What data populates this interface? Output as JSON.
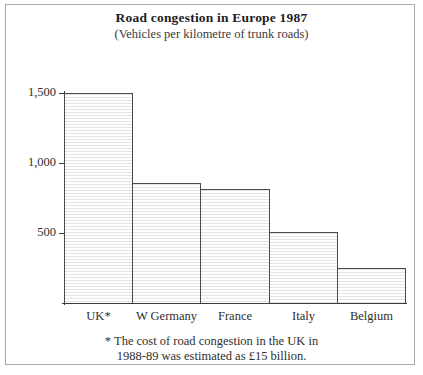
{
  "frame": {
    "border_color": "#a9a9a9",
    "background": "#ffffff"
  },
  "chart_data": {
    "type": "bar",
    "title": "Road congestion in Europe 1987",
    "subtitle": "(Vehicles per kilometre of trunk roads)",
    "xlabel": "",
    "ylabel": "",
    "categories": [
      "UK*",
      "W Germany",
      "France",
      "Italy",
      "Belgium"
    ],
    "values": [
      1500,
      860,
      815,
      505,
      250
    ],
    "ylim": [
      0,
      1500
    ],
    "yticks": [
      500,
      1000,
      1500
    ],
    "ytick_labels": [
      "500",
      "1,000",
      "1,500"
    ],
    "grid": false,
    "legend": null,
    "bar_style": {
      "fill": "#fdfdfd",
      "hatch": "horizontal-lines",
      "hatch_color": "#e3e3e3",
      "outline": "#4a4a4a",
      "contiguous": true
    },
    "axis_color": "#3b3b3b",
    "annotations": [
      "* The cost of road congestion in the UK in",
      "1988-89 was estimated as £15 billion."
    ]
  },
  "footnote": {
    "line1": "* The cost of road congestion in the UK in",
    "line2": "1988-89 was estimated as £15 billion."
  }
}
